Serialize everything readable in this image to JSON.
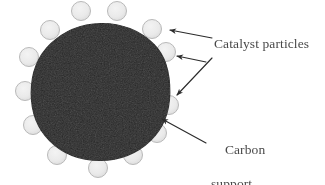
{
  "figure": {
    "width": 325,
    "height": 185,
    "background_color": "#ffffff",
    "kind": "schematic-diagram"
  },
  "labels": {
    "catalyst": "Catalyst particles",
    "carbon_line1": "Carbon",
    "carbon_line2": "support",
    "text_color": "#3a3a3a"
  },
  "support": {
    "name": "carbon-support-sphere",
    "center_x": 100.5,
    "center_y": 93,
    "radius": 69.5,
    "fill_color": "#262626",
    "edge_color": "#1a1a1a"
  },
  "particles": {
    "fill_color": "#e9e9e9",
    "edge_color": "#b9b9b9",
    "radius": 9.5,
    "count": 13,
    "positions": [
      {
        "label": "top-left-of-apex",
        "x": 81,
        "y": 11
      },
      {
        "label": "top-right-of-apex",
        "x": 117,
        "y": 11
      },
      {
        "label": "upper-left",
        "x": 50,
        "y": 30
      },
      {
        "label": "upper-right",
        "x": 152,
        "y": 29
      },
      {
        "label": "left-upper",
        "x": 29,
        "y": 57
      },
      {
        "label": "right-upper",
        "x": 166,
        "y": 52
      },
      {
        "label": "left-middle",
        "x": 25,
        "y": 91
      },
      {
        "label": "right-middle",
        "x": 169,
        "y": 105
      },
      {
        "label": "left-lower",
        "x": 33,
        "y": 125
      },
      {
        "label": "right-lower",
        "x": 157,
        "y": 133
      },
      {
        "label": "bottom-left",
        "x": 57,
        "y": 155
      },
      {
        "label": "bottom-center",
        "x": 98,
        "y": 168
      },
      {
        "label": "bottom-right",
        "x": 133,
        "y": 155
      }
    ]
  },
  "arrows": {
    "stroke_color": "#2b2b2b",
    "items": [
      {
        "name": "catalyst-arrow-upper",
        "points_to": "catalyst particle at upper right of sphere",
        "x1": 212,
        "y1": 38,
        "x2": 169,
        "y2": 30
      },
      {
        "name": "catalyst-arrow-middle",
        "points_to": "catalyst particle at right of sphere",
        "x1": 206,
        "y1": 62,
        "x2": 176,
        "y2": 56
      },
      {
        "name": "catalyst-arrow-lower",
        "points_to": "catalyst particle lower right of sphere",
        "x1": 212,
        "y1": 58,
        "x2": 176,
        "y2": 96
      },
      {
        "name": "carbon-support-arrow",
        "points_to": "dark carbon support sphere edge",
        "x1": 206,
        "y1": 143,
        "x2": 161,
        "y2": 118
      }
    ]
  }
}
